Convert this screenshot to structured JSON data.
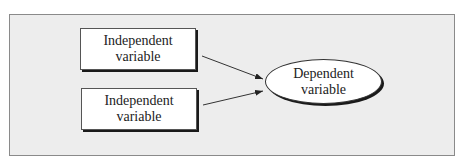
{
  "diagram": {
    "nodes": [
      {
        "id": "iv1",
        "shape": "rectangle",
        "line1": "Independent",
        "line2": "variable"
      },
      {
        "id": "iv2",
        "shape": "rectangle",
        "line1": "Independent",
        "line2": "variable"
      },
      {
        "id": "dv",
        "shape": "ellipse",
        "line1": "Dependent",
        "line2": "variable"
      }
    ],
    "edges": [
      {
        "from": "iv1",
        "to": "dv"
      },
      {
        "from": "iv2",
        "to": "dv"
      }
    ],
    "colors": {
      "background": "#ededed",
      "node_fill": "#ffffff",
      "stroke": "#222222"
    }
  }
}
